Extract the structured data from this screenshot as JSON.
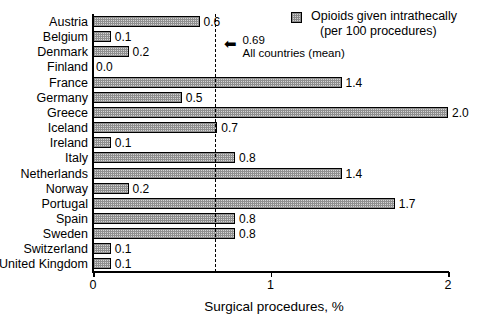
{
  "chart_data": {
    "type": "bar",
    "orientation": "horizontal",
    "title": "",
    "xlabel": "Surgical procedures, %",
    "ylabel": "",
    "xlim": [
      0,
      2
    ],
    "xticks": [
      "0",
      "1",
      "2"
    ],
    "xtick_values": [
      0,
      1,
      2
    ],
    "grid": false,
    "categories": [
      "Austria",
      "Belgium",
      "Denmark",
      "Finland",
      "France",
      "Germany",
      "Greece",
      "Iceland",
      "Ireland",
      "Italy",
      "Netherlands",
      "Norway",
      "Portugal",
      "Spain",
      "Sweden",
      "Switzerland",
      "United Kingdom"
    ],
    "values": [
      0.6,
      0.1,
      0.2,
      0.0,
      1.4,
      0.5,
      2.0,
      0.7,
      0.1,
      0.8,
      1.4,
      0.2,
      1.7,
      0.8,
      0.8,
      0.1,
      0.1
    ],
    "value_labels": [
      "0.6",
      "0.1",
      "0.2",
      "0.0",
      "1.4",
      "0.5",
      "2.0",
      "0.7",
      "0.1",
      "0.8",
      "1.4",
      "0.2",
      "1.7",
      "0.8",
      "0.8",
      "0.1",
      "0.1"
    ],
    "legend": {
      "position": "top-right",
      "entries": [
        {
          "line1": "Opioids given intrathecally",
          "line2": "(per 100 procedures)",
          "swatch": "hatched-grey"
        }
      ]
    },
    "annotations": [
      {
        "type": "reference-line",
        "value": 0.69,
        "style": "dashed",
        "arrow": "←",
        "label_line1": "0.69",
        "label_line2": "All countries (mean)"
      }
    ],
    "colors": {
      "bar_fill": "#d4d4d4",
      "bar_hatch": "#8f8f8f",
      "bar_edge": "#000000",
      "axis": "#000000",
      "text": "#000000",
      "background": "#ffffff"
    }
  }
}
